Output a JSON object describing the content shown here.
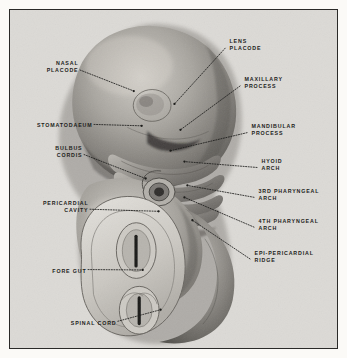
{
  "plate": {
    "background_color": "#dcdad6",
    "paper_color": "#fbfaf7",
    "border_color": "#2a2a28",
    "ink_color": "#1d1d1b",
    "subject": "human-embryo-lateral-view"
  },
  "labels": [
    {
      "id": "nasal-placode",
      "side": "right",
      "lines": [
        "NASAL",
        "PLACODE"
      ],
      "x": 78,
      "y": 60,
      "anchor_x": 135,
      "anchor_y": 92
    },
    {
      "id": "stomatodaeum",
      "side": "right",
      "lines": [
        "STOMATODAEUM"
      ],
      "x": 92,
      "y": 122,
      "anchor_x": 143,
      "anchor_y": 127
    },
    {
      "id": "bulbus-cordis",
      "side": "right",
      "lines": [
        "BULBUS",
        "CORDIS"
      ],
      "x": 82,
      "y": 145,
      "anchor_x": 147,
      "anchor_y": 180
    },
    {
      "id": "pericardial-cavity",
      "side": "right",
      "lines": [
        "PERICARDIAL",
        "CAVITY"
      ],
      "x": 88,
      "y": 200,
      "anchor_x": 160,
      "anchor_y": 213
    },
    {
      "id": "fore-gut",
      "side": "right",
      "lines": [
        "FORE GUT"
      ],
      "x": 86,
      "y": 268,
      "anchor_x": 144,
      "anchor_y": 272
    },
    {
      "id": "spinal-cord",
      "side": "right",
      "lines": [
        "SPINAL CORD"
      ],
      "x": 116,
      "y": 320,
      "anchor_x": 162,
      "anchor_y": 312
    },
    {
      "id": "lens-placode",
      "side": "left",
      "lines": [
        "LENS",
        "PLACODE"
      ],
      "x": 230,
      "y": 38,
      "anchor_x": 176,
      "anchor_y": 105
    },
    {
      "id": "maxillary-process",
      "side": "left",
      "lines": [
        "MAXILLARY",
        "PROCESS"
      ],
      "x": 245,
      "y": 76,
      "anchor_x": 182,
      "anchor_y": 131
    },
    {
      "id": "mandibular-process",
      "side": "left",
      "lines": [
        "MANDIBULAR",
        "PROCESS"
      ],
      "x": 252,
      "y": 123,
      "anchor_x": 172,
      "anchor_y": 152
    },
    {
      "id": "hyoid-arch",
      "side": "left",
      "lines": [
        "HYOID",
        "ARCH"
      ],
      "x": 262,
      "y": 158,
      "anchor_x": 186,
      "anchor_y": 163
    },
    {
      "id": "3rd-pharyngeal-arch",
      "side": "left",
      "lines": [
        "3RD PHARYNGEAL",
        "ARCH"
      ],
      "x": 259,
      "y": 188,
      "anchor_x": 189,
      "anchor_y": 187
    },
    {
      "id": "4th-pharyngeal-arch",
      "side": "left",
      "lines": [
        "4TH PHARYNGEAL",
        "ARCH"
      ],
      "x": 259,
      "y": 218,
      "anchor_x": 186,
      "anchor_y": 199
    },
    {
      "id": "epi-pericardial-ridge",
      "side": "left",
      "lines": [
        "EPI-PERICARDIAL",
        "RIDGE"
      ],
      "x": 255,
      "y": 250,
      "anchor_x": 194,
      "anchor_y": 222
    }
  ]
}
